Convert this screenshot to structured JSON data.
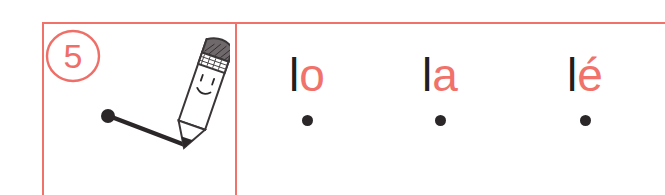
{
  "worksheet": {
    "exercise_number": "5",
    "frame_color": "#f0726b",
    "ink_color": "#231f20",
    "vowel_color": "#f0726b"
  },
  "illustration": {
    "name": "smiling-pencil-drawing-stroke",
    "description": "A smiling pencil character drawing a diagonal stroke from a black starting dot",
    "start_dot": "●"
  },
  "syllables": [
    {
      "consonant": "l",
      "vowel": "o",
      "full": "lo",
      "start_dot": "●"
    },
    {
      "consonant": "l",
      "vowel": "a",
      "full": "la",
      "start_dot": "●"
    },
    {
      "consonant": "l",
      "vowel": "é",
      "full": "lé",
      "start_dot": "●"
    }
  ]
}
